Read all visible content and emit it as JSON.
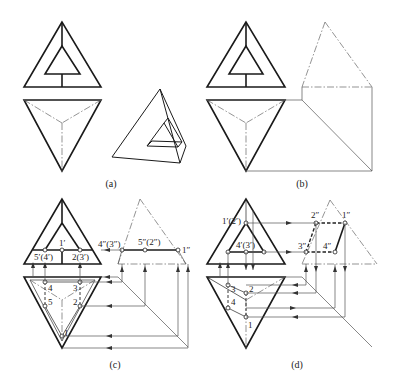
{
  "figure": {
    "type": "orthographic-projection",
    "panels": [
      {
        "id": "a",
        "caption": "(a)",
        "caption_pos": [
          111,
          187
        ]
      },
      {
        "id": "b",
        "caption": "(b)",
        "caption_pos": [
          302,
          187
        ]
      },
      {
        "id": "c",
        "caption": "(c)",
        "caption_pos": [
          115,
          368
        ]
      },
      {
        "id": "d",
        "caption": "(d)",
        "caption_pos": [
          297,
          368
        ]
      }
    ],
    "labels_c": {
      "p1f": "1′",
      "p54f": "5′(4′)",
      "p23f": "2(3′)",
      "p43s": "4″(3″)",
      "p52s": "5″(2″)",
      "p1s": "1″",
      "p4h": "4",
      "p3h": "3",
      "p5h": "5",
      "p2h": "2",
      "p1h": "1"
    },
    "labels_d": {
      "p12f": "1′(2′)",
      "p43f": "4′(3′)",
      "p2s": "2″",
      "p1s": "1″",
      "p3s": "3″",
      "p4s": "4″",
      "p3h": "3",
      "p2h": "2",
      "p4h": "4",
      "p1h": "1"
    },
    "colors": {
      "visible": "#1a1a1a",
      "construction": "#555555",
      "background": "#ffffff"
    }
  }
}
